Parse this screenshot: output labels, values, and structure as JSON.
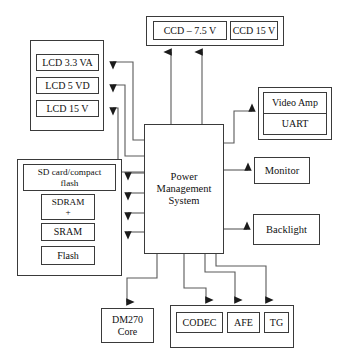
{
  "diagram": {
    "type": "block-diagram",
    "line_color": "#3a3a3a",
    "background": "#ffffff",
    "text_color": "#111111",
    "nodes": {
      "ccd_group": {
        "label": "",
        "children": [
          {
            "id": "ccd_75",
            "label": "CCD – 7.5 V"
          },
          {
            "id": "ccd_15",
            "label": "CCD 15 V"
          }
        ]
      },
      "lcd_group": {
        "label": "",
        "children": [
          {
            "id": "lcd_33va",
            "label": "LCD 3.3 VA"
          },
          {
            "id": "lcd_5vd",
            "label": "LCD 5 VD"
          },
          {
            "id": "lcd_15v",
            "label": "LCD 15 V"
          }
        ]
      },
      "memory_group": {
        "label": "",
        "children": [
          {
            "id": "sd_card",
            "label": "SD card/compact\nflash"
          },
          {
            "id": "sdram",
            "label": "SDRAM\n+"
          },
          {
            "id": "sram",
            "label": "SRAM"
          },
          {
            "id": "flash",
            "label": "Flash"
          }
        ]
      },
      "pms": {
        "id": "pms",
        "label": "Power\nManagement\nSystem"
      },
      "video_group": {
        "label": "",
        "children": [
          {
            "id": "video_amp",
            "label": "Video Amp"
          },
          {
            "id": "uart",
            "label": "UART"
          }
        ]
      },
      "monitor": {
        "id": "monitor",
        "label": "Monitor"
      },
      "backlight": {
        "id": "backlight",
        "label": "Backlight"
      },
      "dm270": {
        "id": "dm270",
        "label": "DM270\nCore"
      },
      "codec_group": {
        "label": "",
        "children": [
          {
            "id": "codec",
            "label": "CODEC"
          },
          {
            "id": "afe",
            "label": "AFE"
          },
          {
            "id": "tg",
            "label": "TG"
          }
        ]
      }
    },
    "connections": [
      {
        "from": "pms",
        "to": "ccd_75",
        "direction": "up"
      },
      {
        "from": "pms",
        "to": "ccd_15",
        "direction": "up"
      },
      {
        "from": "pms",
        "to": "lcd_33va",
        "direction": "left"
      },
      {
        "from": "pms",
        "to": "lcd_5vd",
        "direction": "left"
      },
      {
        "from": "pms",
        "to": "lcd_15v",
        "direction": "left"
      },
      {
        "from": "pms",
        "to": "memory_group",
        "direction": "left"
      },
      {
        "from": "pms",
        "to": "memory_group",
        "direction": "left"
      },
      {
        "from": "pms",
        "to": "memory_group",
        "direction": "left"
      },
      {
        "from": "pms",
        "to": "memory_group",
        "direction": "left"
      },
      {
        "from": "pms",
        "to": "video_amp",
        "direction": "right"
      },
      {
        "from": "pms",
        "to": "monitor",
        "direction": "right"
      },
      {
        "from": "pms",
        "to": "backlight",
        "direction": "right"
      },
      {
        "from": "pms",
        "to": "dm270",
        "direction": "down"
      },
      {
        "from": "pms",
        "to": "codec",
        "direction": "down"
      },
      {
        "from": "pms",
        "to": "afe",
        "direction": "down"
      },
      {
        "from": "pms",
        "to": "tg",
        "direction": "down"
      }
    ]
  }
}
